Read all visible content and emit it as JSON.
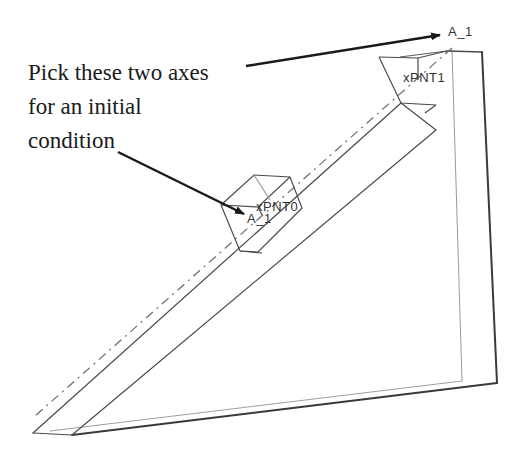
{
  "annotation": {
    "lines": [
      "Pick these two axes",
      "for an initial",
      "condition"
    ]
  },
  "labels": {
    "axis_top": "A_1",
    "axis_block": "A_1",
    "point_upper": "xPNT1",
    "point_lower": "xPNT0"
  },
  "colors": {
    "background": "#ffffff",
    "text": "#1a1a1a",
    "arrow": "#1a1a1a",
    "edge": "#4a4a4a",
    "edge_light": "#9a9a9a",
    "axis_dashed": "#6a6a6a"
  }
}
